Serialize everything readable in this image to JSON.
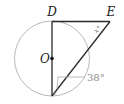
{
  "figure": {
    "labels": {
      "D": "D",
      "E": "E",
      "O": "O",
      "x_angle": "x°",
      "y_angle": "y",
      "given_angle": "38°"
    },
    "colors": {
      "circle": "#b8b8b8",
      "lines": "#2a2a2a",
      "leader": "#a8a8a8",
      "label_text": "#222222",
      "angle_label_text": "#8a8a8a"
    },
    "geometry": {
      "circle": {
        "cx": 52,
        "cy": 58.5,
        "r": 37.5
      },
      "D": [
        52,
        21
      ],
      "E": [
        110,
        22
      ],
      "bottom": [
        52,
        96
      ],
      "O": [
        52,
        58.5
      ]
    }
  }
}
